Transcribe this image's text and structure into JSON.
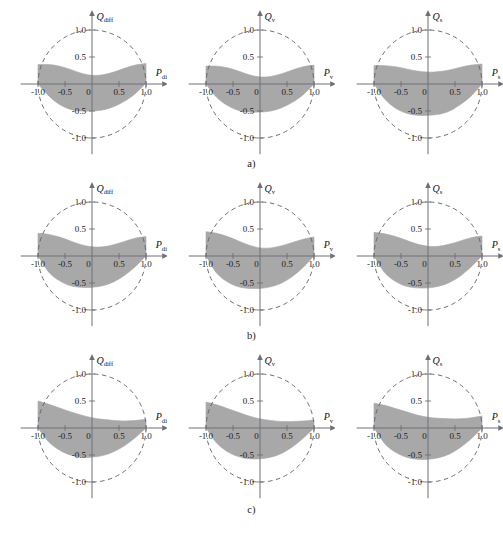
{
  "figure": {
    "background_color": "#ffffff",
    "shade_color": "#a8a8a8",
    "axis_color": "#6f6f78",
    "circle_color": "#5d5d66",
    "rows": [
      {
        "label": "a)"
      },
      {
        "label": "b)"
      },
      {
        "label": "c)"
      }
    ],
    "columns": [
      {
        "x_symbol": "P",
        "x_subscript": "diff",
        "y_symbol": "Q",
        "y_subscript": "diff"
      },
      {
        "x_symbol": "P",
        "x_subscript": "v",
        "y_symbol": "Q",
        "y_subscript": "v"
      },
      {
        "x_symbol": "P",
        "x_subscript": "s",
        "y_symbol": "Q",
        "y_subscript": "s"
      }
    ],
    "x_tick_labels": [
      "-1.0",
      "-0.5",
      "0",
      "0.5",
      "1.0"
    ],
    "x_tick_values": [
      -1.0,
      -0.5,
      0,
      0.5,
      1.0
    ],
    "y_tick_labels": [
      "1.0",
      "0.5",
      "-0.5",
      "-1.0"
    ],
    "y_tick_values": [
      1.0,
      0.5,
      -0.5,
      -1.0
    ]
  },
  "chart_data": {
    "type": "area",
    "title": "",
    "xlabel": "P",
    "ylabel": "Q",
    "xlim": [
      -1.35,
      1.35
    ],
    "ylim": [
      -1.3,
      1.3
    ],
    "grid": false,
    "legend": "none",
    "unit_circle_radius": 1.0,
    "unit_circle_style": "dashed",
    "panels": [
      {
        "id": "a1",
        "row": "a)",
        "column": 1,
        "xlabel": "P_diff",
        "ylabel": "Q_diff",
        "upper_boundary": {
          "x": [
            -1.0,
            -0.8,
            -0.6,
            -0.4,
            -0.2,
            0.0,
            0.2,
            0.4,
            0.6,
            0.8,
            1.0
          ],
          "y": [
            0.36,
            0.36,
            0.33,
            0.27,
            0.2,
            0.16,
            0.17,
            0.22,
            0.29,
            0.35,
            0.38
          ]
        },
        "lower_boundary": {
          "x": [
            -1.0,
            -0.8,
            -0.6,
            -0.4,
            -0.2,
            0.0,
            0.2,
            0.4,
            0.6,
            0.8,
            1.0
          ],
          "y": [
            0.0,
            -0.22,
            -0.38,
            -0.47,
            -0.5,
            -0.5,
            -0.48,
            -0.42,
            -0.32,
            -0.18,
            0.02
          ]
        }
      },
      {
        "id": "a2",
        "row": "a)",
        "column": 2,
        "xlabel": "P_v",
        "ylabel": "Q_v",
        "upper_boundary": {
          "x": [
            -1.0,
            -0.8,
            -0.6,
            -0.4,
            -0.2,
            0.0,
            0.2,
            0.4,
            0.6,
            0.8,
            1.0
          ],
          "y": [
            0.33,
            0.33,
            0.3,
            0.24,
            0.17,
            0.13,
            0.14,
            0.19,
            0.26,
            0.32,
            0.35
          ]
        },
        "lower_boundary": {
          "x": [
            -1.0,
            -0.8,
            -0.6,
            -0.4,
            -0.2,
            0.0,
            0.2,
            0.4,
            0.6,
            0.8,
            1.0
          ],
          "y": [
            0.0,
            -0.25,
            -0.4,
            -0.49,
            -0.52,
            -0.52,
            -0.5,
            -0.44,
            -0.34,
            -0.2,
            0.0
          ]
        }
      },
      {
        "id": "a3",
        "row": "a)",
        "column": 3,
        "xlabel": "P_s",
        "ylabel": "Q_s",
        "upper_boundary": {
          "x": [
            -1.0,
            -0.8,
            -0.6,
            -0.4,
            -0.2,
            0.0,
            0.2,
            0.4,
            0.6,
            0.8,
            1.0
          ],
          "y": [
            0.34,
            0.34,
            0.32,
            0.28,
            0.24,
            0.22,
            0.23,
            0.26,
            0.31,
            0.35,
            0.37
          ]
        },
        "lower_boundary": {
          "x": [
            -1.0,
            -0.8,
            -0.6,
            -0.4,
            -0.2,
            0.0,
            0.2,
            0.4,
            0.6,
            0.8,
            1.0
          ],
          "y": [
            0.0,
            -0.28,
            -0.45,
            -0.54,
            -0.58,
            -0.58,
            -0.56,
            -0.5,
            -0.38,
            -0.22,
            0.0
          ]
        }
      },
      {
        "id": "b1",
        "row": "b)",
        "column": 1,
        "xlabel": "P_diff",
        "ylabel": "Q_diff",
        "upper_boundary": {
          "x": [
            -1.0,
            -0.8,
            -0.6,
            -0.4,
            -0.2,
            0.0,
            0.2,
            0.4,
            0.6,
            0.8,
            1.0
          ],
          "y": [
            0.42,
            0.4,
            0.35,
            0.28,
            0.21,
            0.17,
            0.17,
            0.21,
            0.27,
            0.33,
            0.36
          ]
        },
        "lower_boundary": {
          "x": [
            -1.0,
            -0.8,
            -0.6,
            -0.4,
            -0.2,
            0.0,
            0.2,
            0.4,
            0.6,
            0.8,
            1.0
          ],
          "y": [
            0.0,
            -0.3,
            -0.46,
            -0.55,
            -0.58,
            -0.58,
            -0.55,
            -0.48,
            -0.36,
            -0.2,
            0.0
          ]
        }
      },
      {
        "id": "b2",
        "row": "b)",
        "column": 2,
        "xlabel": "P_v",
        "ylabel": "Q_v",
        "upper_boundary": {
          "x": [
            -1.0,
            -0.8,
            -0.6,
            -0.4,
            -0.2,
            0.0,
            0.2,
            0.4,
            0.6,
            0.8,
            1.0
          ],
          "y": [
            0.45,
            0.42,
            0.36,
            0.28,
            0.2,
            0.15,
            0.15,
            0.19,
            0.25,
            0.31,
            0.35
          ]
        },
        "lower_boundary": {
          "x": [
            -1.0,
            -0.8,
            -0.6,
            -0.4,
            -0.2,
            0.0,
            0.2,
            0.4,
            0.6,
            0.8,
            1.0
          ],
          "y": [
            0.0,
            -0.32,
            -0.48,
            -0.57,
            -0.6,
            -0.6,
            -0.57,
            -0.5,
            -0.38,
            -0.21,
            0.0
          ]
        }
      },
      {
        "id": "b3",
        "row": "b)",
        "column": 3,
        "xlabel": "P_s",
        "ylabel": "Q_s",
        "upper_boundary": {
          "x": [
            -1.0,
            -0.8,
            -0.6,
            -0.4,
            -0.2,
            0.0,
            0.2,
            0.4,
            0.6,
            0.8,
            1.0
          ],
          "y": [
            0.44,
            0.41,
            0.36,
            0.29,
            0.22,
            0.18,
            0.18,
            0.22,
            0.28,
            0.34,
            0.37
          ]
        },
        "lower_boundary": {
          "x": [
            -1.0,
            -0.8,
            -0.6,
            -0.4,
            -0.2,
            0.0,
            0.2,
            0.4,
            0.6,
            0.8,
            1.0
          ],
          "y": [
            0.0,
            -0.31,
            -0.47,
            -0.56,
            -0.59,
            -0.59,
            -0.56,
            -0.49,
            -0.37,
            -0.2,
            0.0
          ]
        }
      },
      {
        "id": "c1",
        "row": "c)",
        "column": 1,
        "xlabel": "P_diff",
        "ylabel": "Q_diff",
        "upper_boundary": {
          "x": [
            -1.0,
            -0.8,
            -0.6,
            -0.4,
            -0.2,
            0.0,
            0.2,
            0.4,
            0.6,
            0.8,
            1.0
          ],
          "y": [
            0.5,
            0.44,
            0.37,
            0.3,
            0.24,
            0.19,
            0.16,
            0.14,
            0.13,
            0.14,
            0.16
          ]
        },
        "lower_boundary": {
          "x": [
            -1.0,
            -0.8,
            -0.6,
            -0.4,
            -0.2,
            0.0,
            0.2,
            0.4,
            0.6,
            0.8,
            1.0
          ],
          "y": [
            0.0,
            -0.26,
            -0.41,
            -0.5,
            -0.54,
            -0.54,
            -0.51,
            -0.44,
            -0.33,
            -0.18,
            0.0
          ]
        }
      },
      {
        "id": "c2",
        "row": "c)",
        "column": 2,
        "xlabel": "P_v",
        "ylabel": "Q_v",
        "upper_boundary": {
          "x": [
            -1.0,
            -0.8,
            -0.6,
            -0.4,
            -0.2,
            0.0,
            0.2,
            0.4,
            0.6,
            0.8,
            1.0
          ],
          "y": [
            0.48,
            0.43,
            0.36,
            0.29,
            0.22,
            0.17,
            0.14,
            0.12,
            0.12,
            0.13,
            0.15
          ]
        },
        "lower_boundary": {
          "x": [
            -1.0,
            -0.8,
            -0.6,
            -0.4,
            -0.2,
            0.0,
            0.2,
            0.4,
            0.6,
            0.8,
            1.0
          ],
          "y": [
            0.0,
            -0.28,
            -0.44,
            -0.53,
            -0.57,
            -0.57,
            -0.54,
            -0.47,
            -0.35,
            -0.19,
            0.0
          ]
        }
      },
      {
        "id": "c3",
        "row": "c)",
        "column": 3,
        "xlabel": "P_s",
        "ylabel": "Q_s",
        "upper_boundary": {
          "x": [
            -1.0,
            -0.8,
            -0.6,
            -0.4,
            -0.2,
            0.0,
            0.2,
            0.4,
            0.6,
            0.8,
            1.0
          ],
          "y": [
            0.46,
            0.42,
            0.36,
            0.3,
            0.24,
            0.2,
            0.18,
            0.17,
            0.17,
            0.19,
            0.22
          ]
        },
        "lower_boundary": {
          "x": [
            -1.0,
            -0.8,
            -0.6,
            -0.4,
            -0.2,
            0.0,
            0.2,
            0.4,
            0.6,
            0.8,
            1.0
          ],
          "y": [
            0.0,
            -0.29,
            -0.45,
            -0.54,
            -0.58,
            -0.58,
            -0.55,
            -0.48,
            -0.36,
            -0.2,
            0.0
          ]
        }
      }
    ]
  }
}
